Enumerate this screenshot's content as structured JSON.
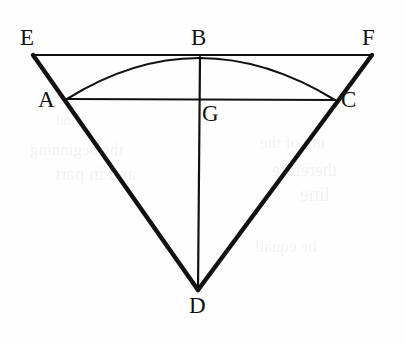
{
  "figure": {
    "canvas": {
      "width": 405,
      "height": 345
    },
    "background_color": "#fefefe",
    "ink_color": "#111111",
    "stroke_thick": 4.2,
    "stroke_thin": 2.0,
    "points": {
      "E": {
        "label": "E",
        "x": 33,
        "y": 55,
        "label_x": 20,
        "label_y": 26
      },
      "B": {
        "label": "B",
        "x": 200,
        "y": 57,
        "label_x": 191,
        "label_y": 26
      },
      "F": {
        "label": "F",
        "x": 372,
        "y": 55,
        "label_x": 362,
        "label_y": 26
      },
      "A": {
        "label": "A",
        "x": 67,
        "y": 99,
        "label_x": 38,
        "label_y": 88
      },
      "G": {
        "label": "G",
        "x": 200,
        "y": 100,
        "label_x": 202,
        "label_y": 102
      },
      "C": {
        "label": "C",
        "x": 335,
        "y": 100,
        "label_x": 341,
        "label_y": 88
      },
      "D": {
        "label": "D",
        "x": 198,
        "y": 290,
        "label_x": 189,
        "label_y": 294
      }
    },
    "segments": [
      {
        "name": "segment-EF",
        "from": "E",
        "to": "F",
        "weight": "thin"
      },
      {
        "name": "segment-ED",
        "from": "E",
        "to": "D",
        "weight": "thick"
      },
      {
        "name": "segment-FD",
        "from": "F",
        "to": "D",
        "weight": "thick"
      },
      {
        "name": "segment-AC",
        "from": "A",
        "to": "C",
        "weight": "thin"
      },
      {
        "name": "segment-BD",
        "from": "B",
        "to": "D",
        "weight": "thin"
      }
    ],
    "arc": {
      "name": "arc-ABC",
      "from": "A",
      "through": "B",
      "to": "C",
      "apex_x": 200,
      "apex_y": 58,
      "weight": "thin"
    },
    "ghost_marks": [
      {
        "text": "the beginning",
        "x": 30,
        "y": 140,
        "size": 17
      },
      {
        "text": "and in part",
        "x": 55,
        "y": 163,
        "size": 19
      },
      {
        "text": "ure of the",
        "x": 260,
        "y": 133,
        "size": 17
      },
      {
        "text": "therefore",
        "x": 272,
        "y": 160,
        "size": 18
      },
      {
        "text": "line",
        "x": 300,
        "y": 183,
        "size": 20
      },
      {
        "text": "be equall",
        "x": 255,
        "y": 237,
        "size": 17
      },
      {
        "text": "and",
        "x": 56,
        "y": 112,
        "size": 15
      }
    ]
  }
}
